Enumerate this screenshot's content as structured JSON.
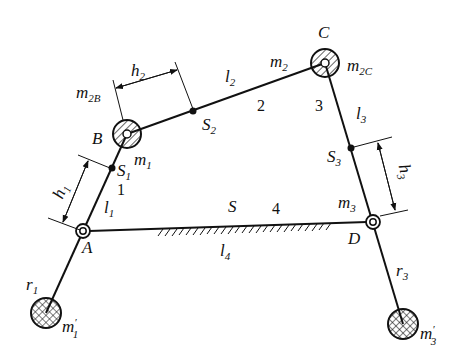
{
  "diagram": {
    "joints": {
      "A": {
        "label": "A",
        "x": 83,
        "y": 231
      },
      "B": {
        "label": "B",
        "x": 127,
        "y": 134
      },
      "C": {
        "label": "C",
        "x": 325,
        "y": 63
      },
      "D": {
        "label": "D",
        "x": 373,
        "y": 222
      }
    },
    "centers_of_mass": {
      "S1": {
        "main": "S",
        "sub": "1",
        "x": 112,
        "y": 168
      },
      "S2": {
        "main": "S",
        "sub": "2",
        "x": 193,
        "y": 111
      },
      "S3": {
        "main": "S",
        "sub": "3",
        "x": 351,
        "y": 148
      },
      "S": {
        "main": "S"
      }
    },
    "link_numbers": {
      "link1": "1",
      "link2": "2",
      "link3": "3",
      "link4": "4"
    },
    "lengths": {
      "l1": {
        "main": "l",
        "sub": "1"
      },
      "l2": {
        "main": "l",
        "sub": "2"
      },
      "l3": {
        "main": "l",
        "sub": "3"
      },
      "l4": {
        "main": "l",
        "sub": "4"
      }
    },
    "distances": {
      "h1": {
        "main": "h",
        "sub": "1"
      },
      "h2": {
        "main": "h",
        "sub": "2"
      },
      "h3": {
        "main": "h",
        "sub": "3"
      }
    },
    "radii": {
      "r1": {
        "main": "r",
        "sub": "1"
      },
      "r3": {
        "main": "r",
        "sub": "3"
      }
    },
    "masses": {
      "m1": {
        "main": "m",
        "sub": "1"
      },
      "m2": {
        "main": "m",
        "sub": "2"
      },
      "m3": {
        "main": "m",
        "sub": "3"
      },
      "m2B": {
        "main": "m",
        "sub": "2B"
      },
      "m2C": {
        "main": "m",
        "sub": "2C"
      },
      "m1p": {
        "main": "m",
        "prime": "′",
        "sub": "1"
      },
      "m3p": {
        "main": "m",
        "prime": "′",
        "sub": "3"
      }
    },
    "counterweights": {
      "m1p": {
        "x": 46,
        "y": 313,
        "r": 15
      },
      "m3p": {
        "x": 403,
        "y": 324,
        "r": 15
      }
    },
    "colors": {
      "stroke": "#111111",
      "background": "#ffffff"
    }
  }
}
